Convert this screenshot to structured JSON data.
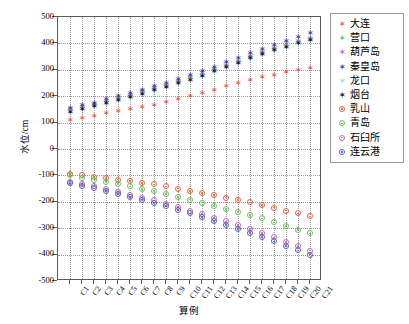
{
  "chart_data": {
    "type": "scatter",
    "title": "",
    "xlabel": "算例",
    "ylabel": "水位/cm",
    "xlim": [
      0,
      22
    ],
    "ylim": [
      -500,
      500
    ],
    "yticks": [
      500,
      400,
      300,
      200,
      100,
      0,
      -100,
      -200,
      -300,
      -400,
      -500
    ],
    "ytick_labels": [
      "500",
      "400",
      "300",
      "200",
      "100",
      "0",
      "-100",
      "-200",
      "-300",
      "-400",
      "-500"
    ],
    "grid": true,
    "legend_position": "right",
    "categories": [
      "C1",
      "C2",
      "C3",
      "C4",
      "C5",
      "C6",
      "C7",
      "C8",
      "C9",
      "C10",
      "C11",
      "C12",
      "C13",
      "C14",
      "C15",
      "C16",
      "C17",
      "C18",
      "C19",
      "C20",
      "C21"
    ],
    "series": [
      {
        "name": "大连",
        "color": "#e8613c",
        "marker": "star",
        "values": [
          110,
          118,
          125,
          135,
          143,
          152,
          160,
          168,
          178,
          190,
          200,
          212,
          225,
          238,
          250,
          262,
          272,
          282,
          292,
          300,
          308
        ]
      },
      {
        "name": "营口",
        "color": "#6bbf59",
        "marker": "star",
        "values": [
          148,
          158,
          168,
          180,
          190,
          202,
          215,
          228,
          240,
          255,
          268,
          282,
          298,
          315,
          330,
          348,
          362,
          378,
          392,
          405,
          418
        ]
      },
      {
        "name": "葫芦岛",
        "color": "#c06ab0",
        "marker": "star",
        "values": [
          150,
          160,
          170,
          182,
          192,
          205,
          218,
          230,
          243,
          258,
          271,
          286,
          302,
          318,
          334,
          352,
          366,
          382,
          396,
          410,
          422
        ]
      },
      {
        "name": "秦皇岛",
        "color": "#3d3d9e",
        "marker": "star",
        "values": [
          155,
          166,
          176,
          188,
          199,
          212,
          225,
          238,
          251,
          266,
          280,
          295,
          312,
          329,
          345,
          363,
          378,
          394,
          408,
          424,
          438
        ]
      },
      {
        "name": "龙口",
        "color": "#a8d8ea",
        "marker": "star",
        "values": [
          140,
          150,
          160,
          172,
          182,
          195,
          208,
          220,
          233,
          248,
          261,
          276,
          292,
          308,
          324,
          342,
          356,
          372,
          386,
          400,
          412
        ]
      },
      {
        "name": "烟台",
        "color": "#111111",
        "marker": "star",
        "values": [
          142,
          152,
          162,
          174,
          184,
          197,
          210,
          222,
          235,
          250,
          263,
          278,
          294,
          310,
          326,
          344,
          358,
          374,
          388,
          402,
          414
        ]
      },
      {
        "name": "乳山",
        "color": "#e8613c",
        "marker": "open-circle",
        "values": [
          -95,
          -100,
          -105,
          -110,
          -116,
          -122,
          -128,
          -134,
          -142,
          -150,
          -158,
          -166,
          -175,
          -184,
          -193,
          -202,
          -211,
          -222,
          -233,
          -244,
          -255
        ]
      },
      {
        "name": "青岛",
        "color": "#6bbf59",
        "marker": "open-circle",
        "values": [
          -100,
          -108,
          -116,
          -124,
          -133,
          -142,
          -151,
          -160,
          -170,
          -181,
          -192,
          -203,
          -215,
          -227,
          -239,
          -251,
          -263,
          -278,
          -292,
          -306,
          -320
        ]
      },
      {
        "name": "石臼所",
        "color": "#c06ab0",
        "marker": "open-circle",
        "values": [
          -125,
          -133,
          -142,
          -152,
          -162,
          -173,
          -184,
          -195,
          -207,
          -220,
          -233,
          -246,
          -260,
          -274,
          -288,
          -303,
          -318,
          -335,
          -352,
          -368,
          -385
        ]
      },
      {
        "name": "连云港",
        "color": "#5b5bbf",
        "marker": "open-circle",
        "values": [
          -130,
          -139,
          -149,
          -159,
          -170,
          -181,
          -192,
          -204,
          -217,
          -230,
          -244,
          -258,
          -272,
          -287,
          -302,
          -318,
          -333,
          -350,
          -367,
          -384,
          -400
        ]
      }
    ]
  }
}
